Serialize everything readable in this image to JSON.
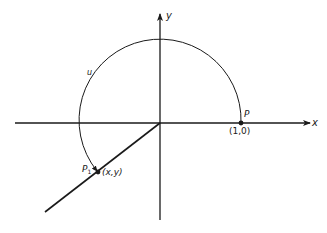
{
  "diagram": {
    "type": "unit-circle-arc",
    "colors": {
      "ink": "#1a1a1a",
      "background": "#ffffff"
    },
    "axes": {
      "x_label": "x",
      "y_label": "y"
    },
    "points": {
      "p": {
        "label": "P",
        "coords": "(1,0)"
      },
      "p1": {
        "label": "P",
        "subscript": "1",
        "coords": "(x,y)"
      }
    },
    "arc": {
      "label": "u"
    }
  }
}
